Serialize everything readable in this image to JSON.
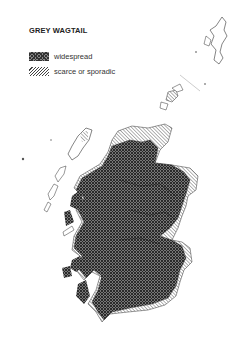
{
  "title": "GREY WAGTAIL",
  "legend": {
    "items": [
      {
        "label": "widespread",
        "pattern": "cross-hatch-dark"
      },
      {
        "label": "scarce or sporadic",
        "pattern": "diagonal-hatch-light"
      }
    ]
  },
  "map": {
    "region": "Scotland",
    "colors": {
      "widespread": "#555555",
      "scarce": "#aaaaaa",
      "outline": "#333333"
    }
  }
}
